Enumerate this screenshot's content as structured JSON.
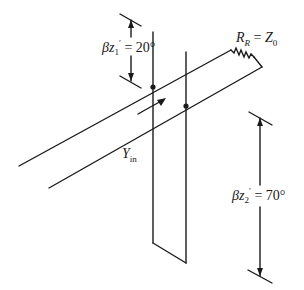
{
  "diagram": {
    "labels": {
      "stub_distance": {
        "symbol": "βz",
        "sub": "1",
        "prime": "′",
        "eq": " = ",
        "value": "20°"
      },
      "stub_length": {
        "symbol": "βz",
        "sub": "2",
        "prime": "′",
        "eq": " = ",
        "value": "70°"
      },
      "load": {
        "symbol": "R",
        "sub": "R",
        "eq": " = ",
        "rhs": "Z",
        "rhs_sub": "0"
      },
      "input_admittance": {
        "symbol": "Y",
        "sub": "in"
      }
    },
    "colors": {
      "line": "#1a1a1a",
      "background": "#ffffff"
    }
  }
}
